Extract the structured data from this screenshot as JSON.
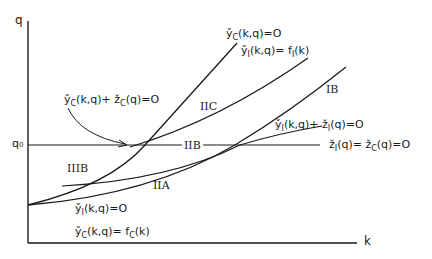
{
  "axes": {
    "x_label": "k",
    "y_label": "q",
    "q0_label": "q₀"
  },
  "curves": [
    {
      "id": "yC-zero",
      "label_base": "y̌C(k,q)=0",
      "parts": [
        "y̌",
        "C",
        "(k,q)=O"
      ]
    },
    {
      "id": "yI-fI",
      "parts": [
        "y̌",
        "I",
        "(k,q)= f",
        "I",
        "(k)"
      ]
    },
    {
      "id": "yC-zC",
      "parts": [
        "y̌",
        "C",
        "(k,q)+ ž",
        "C",
        "(q)=O"
      ]
    },
    {
      "id": "yI-zI",
      "parts": [
        "y̌",
        "I",
        "(k,q)+ ž",
        "I",
        "(q)=O"
      ]
    },
    {
      "id": "zI-zC",
      "parts": [
        "ž",
        "I",
        "(q)= ž",
        "C",
        "(q)=O"
      ]
    },
    {
      "id": "yI-zero",
      "parts": [
        "y̌",
        "I",
        "(k,q)=O"
      ]
    },
    {
      "id": "yC-fC",
      "parts": [
        "y̌",
        "C",
        "(k,q)= f",
        "C",
        "(k)"
      ]
    }
  ],
  "regions": {
    "IB": "IB",
    "IIC": "IIC",
    "IIB": "IIB",
    "IIIB": "IIIB",
    "IIA": "IIA"
  },
  "colors": {
    "ink": "#1a1a1a",
    "background": "#ffffff"
  }
}
